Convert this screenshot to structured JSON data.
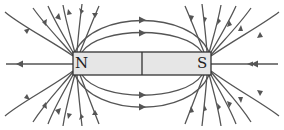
{
  "diagram": {
    "magnet": {
      "north_label": "N",
      "south_label": "S",
      "fill": "#e6e6e6",
      "stroke": "#333333"
    },
    "line_color": "#555555",
    "arrow_direction": "from N to S (outward at N, inward at S)"
  }
}
